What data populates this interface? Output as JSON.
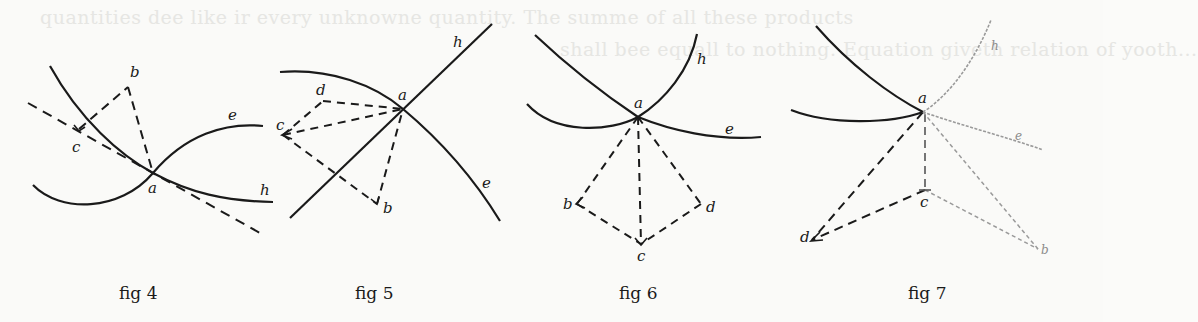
{
  "page": {
    "bleed_through_lines": [
      "quantities dee like ir every unknowne quantity. The summe of all these products",
      "shall bee equall to nothing. Equation giveth relation of yooth...",
      "Re",
      "line) Contrarie what is...",
      "to one side of y ...",
      "x"
    ]
  },
  "figures": [
    {
      "id": "fig4",
      "caption": "fig 4",
      "labels": {
        "a": "a",
        "b": "b",
        "c": "c",
        "e": "e",
        "h": "h"
      }
    },
    {
      "id": "fig5",
      "caption": "fig 5",
      "labels": {
        "a": "a",
        "b": "b",
        "c": "c",
        "d": "d",
        "e": "e",
        "h": "h"
      }
    },
    {
      "id": "fig6",
      "caption": "fig 6",
      "labels": {
        "a": "a",
        "b": "b",
        "c": "c",
        "d": "d",
        "e": "e",
        "h": "h"
      }
    },
    {
      "id": "fig7",
      "caption": "fig 7",
      "labels": {
        "a": "a",
        "b": "b",
        "c": "c",
        "d": "d",
        "e": "e",
        "h": "h"
      }
    }
  ],
  "colors": {
    "ink": "#1a1a1a",
    "faded_ink": "#8c8c8c",
    "paper": "#fafaf8"
  }
}
